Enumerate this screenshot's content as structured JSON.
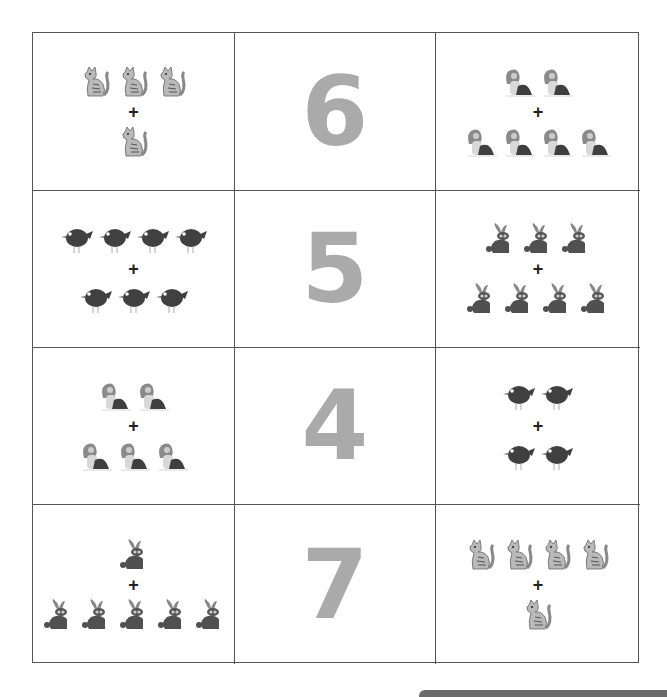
{
  "worksheet": {
    "title": "Addition matching worksheet",
    "rows": [
      {
        "left": {
          "animal": "cat",
          "top_count": 3,
          "bottom_count": 1
        },
        "number": "6",
        "right": {
          "animal": "dog",
          "top_count": 2,
          "bottom_count": 4
        }
      },
      {
        "left": {
          "animal": "bird",
          "top_count": 4,
          "bottom_count": 3
        },
        "number": "5",
        "right": {
          "animal": "rabbit",
          "top_count": 3,
          "bottom_count": 4
        }
      },
      {
        "left": {
          "animal": "dog",
          "top_count": 2,
          "bottom_count": 3
        },
        "number": "4",
        "right": {
          "animal": "bird",
          "top_count": 2,
          "bottom_count": 2
        }
      },
      {
        "left": {
          "animal": "rabbit",
          "top_count": 1,
          "bottom_count": 5
        },
        "number": "7",
        "right": {
          "animal": "cat",
          "top_count": 4,
          "bottom_count": 1
        }
      }
    ],
    "operator": "+",
    "colors": {
      "number": "#aaaaaa",
      "border": "#555555",
      "plus": "#222222"
    }
  }
}
